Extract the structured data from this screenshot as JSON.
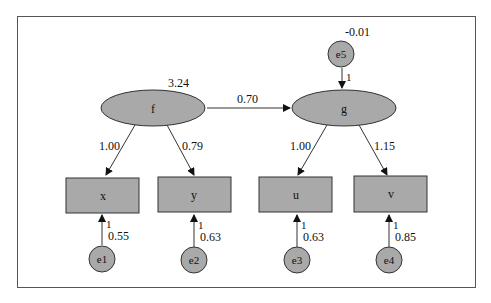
{
  "diagram": {
    "type": "structural-equation-model path diagram",
    "colors": {
      "node_fill": "#a9a9a9",
      "stroke": "#333333",
      "frame": "#555555",
      "background": "#ffffff"
    },
    "latent_nodes": [
      {
        "id": "f",
        "label": "f",
        "variance": "3.24"
      },
      {
        "id": "g",
        "label": "g"
      }
    ],
    "observed_nodes": [
      {
        "id": "x",
        "label": "x"
      },
      {
        "id": "y",
        "label": "y"
      },
      {
        "id": "u",
        "label": "u"
      },
      {
        "id": "v",
        "label": "v"
      }
    ],
    "error_nodes": [
      {
        "id": "e1",
        "label": "e1",
        "path": "1",
        "variance": "0.55"
      },
      {
        "id": "e2",
        "label": "e2",
        "path": "1",
        "variance": "0.63"
      },
      {
        "id": "e3",
        "label": "e3",
        "path": "1",
        "variance": "0.63"
      },
      {
        "id": "e4",
        "label": "e4",
        "path": "1",
        "variance": "0.85"
      },
      {
        "id": "e5",
        "label": "e5",
        "path": "1",
        "variance": "-0.01"
      }
    ],
    "paths": [
      {
        "from": "f",
        "to": "g",
        "label": "0.70"
      },
      {
        "from": "f",
        "to": "x",
        "label": "1.00"
      },
      {
        "from": "f",
        "to": "y",
        "label": "0.79"
      },
      {
        "from": "g",
        "to": "u",
        "label": "1.00"
      },
      {
        "from": "g",
        "to": "v",
        "label": "1.15"
      }
    ]
  }
}
